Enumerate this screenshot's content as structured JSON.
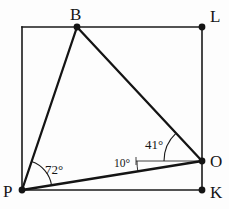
{
  "figure": {
    "type": "geometry-diagram",
    "background_color": "#fdfdfd",
    "stroke_color": "#1a1a1a",
    "vertex_dot_color": "#141414"
  },
  "vertices": [
    {
      "id": "B",
      "label": "B",
      "x": 77,
      "y": 27,
      "label_x": 70,
      "label_y": 6,
      "dot": true
    },
    {
      "id": "L",
      "label": "L",
      "x": 202,
      "y": 27,
      "label_x": 210,
      "label_y": 8,
      "dot": true
    },
    {
      "id": "O",
      "label": "O",
      "x": 202,
      "y": 161,
      "label_x": 210,
      "label_y": 153,
      "dot": true
    },
    {
      "id": "K",
      "label": "K",
      "x": 202,
      "y": 190,
      "label_x": 210,
      "label_y": 184,
      "dot": true
    },
    {
      "id": "P",
      "label": "P",
      "x": 22,
      "y": 190,
      "label_x": 3,
      "label_y": 183,
      "dot": true
    }
  ],
  "segments": [
    {
      "id": "top-edge",
      "from": "corner-TL",
      "to": "L",
      "x1": 22,
      "y1": 27,
      "x2": 202,
      "y2": 27,
      "width": 1.6
    },
    {
      "id": "left-edge",
      "from": "corner-TL",
      "to": "P",
      "x1": 22,
      "y1": 27,
      "x2": 22,
      "y2": 190,
      "width": 1.6
    },
    {
      "id": "right-edge-L-O",
      "from": "L",
      "to": "O",
      "x1": 202,
      "y1": 27,
      "x2": 202,
      "y2": 161,
      "width": 1.6
    },
    {
      "id": "right-edge-O-K",
      "from": "O",
      "to": "K",
      "x1": 202,
      "y1": 161,
      "x2": 202,
      "y2": 190,
      "width": 1.6
    },
    {
      "id": "bottom-edge",
      "from": "P",
      "to": "K",
      "x1": 22,
      "y1": 190,
      "x2": 202,
      "y2": 190,
      "width": 1.6
    },
    {
      "id": "segment-P-B",
      "from": "P",
      "to": "B",
      "x1": 22,
      "y1": 190,
      "x2": 77,
      "y2": 27,
      "width": 2.2
    },
    {
      "id": "segment-B-O",
      "from": "B",
      "to": "O",
      "x1": 77,
      "y1": 27,
      "x2": 202,
      "y2": 161,
      "width": 2.2
    },
    {
      "id": "segment-P-O",
      "from": "P",
      "to": "O",
      "x1": 22,
      "y1": 190,
      "x2": 202,
      "y2": 161,
      "width": 2.2
    },
    {
      "id": "reference-ray-O",
      "from": "O",
      "to": "ref",
      "x1": 202,
      "y1": 161,
      "x2": 137,
      "y2": 161,
      "width": 0.9
    }
  ],
  "angles": [
    {
      "id": "angle-at-P",
      "vertex": "P",
      "value": "72°",
      "between": [
        "P-B",
        "P-O"
      ],
      "label_x": 45,
      "label_y": 163,
      "arc": {
        "cx": 22,
        "cy": 190,
        "r": 30,
        "start_deg": 71.4,
        "end_deg": 9.1
      }
    },
    {
      "id": "angle-at-O-to-B",
      "vertex": "O",
      "value": "41°",
      "between": [
        "O-B",
        "O-reference"
      ],
      "label_x": 145,
      "label_y": 138,
      "arc": {
        "cx": 202,
        "cy": 161,
        "r": 38,
        "start_deg": 180,
        "end_deg": 133.0
      }
    },
    {
      "id": "angle-at-O-to-P",
      "vertex": "O",
      "value": "10°",
      "between": [
        "O-P",
        "O-reference"
      ],
      "label_x": 114,
      "label_y": 158,
      "arc": {
        "cx": 202,
        "cy": 161,
        "r": 65,
        "start_deg": 180,
        "end_deg": 170.9
      }
    }
  ],
  "accessibility": {
    "description": "Rectangle with corners at top-left, L top-right, K bottom-right, and P bottom-left. Point B sits on the top edge and point O sits on the right edge. Segments PB, BO, and PO form a triangle. Angle BPO is 72 degrees, angle between OB and the horizontal at O is 41 degrees, and angle between OP and the horizontal at O is 10 degrees."
  }
}
